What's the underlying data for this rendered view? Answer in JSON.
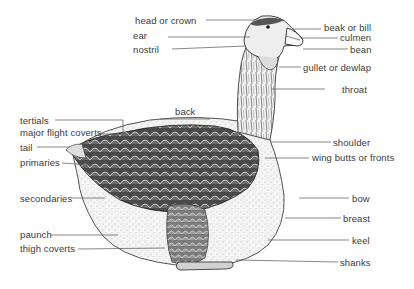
{
  "diagram": {
    "labels": [
      {
        "id": "head-or-crown",
        "text": "head or crown",
        "x": 135,
        "y": 15,
        "line": [
          206,
          20,
          258,
          20
        ]
      },
      {
        "id": "ear",
        "text": "ear",
        "x": 133,
        "y": 30,
        "line": [
          168,
          37,
          250,
          37
        ]
      },
      {
        "id": "nostril",
        "text": "nostril",
        "x": 133,
        "y": 44,
        "line": [
          172,
          49,
          246,
          46
        ]
      },
      {
        "id": "beak-or-bill",
        "text": "beak or bill",
        "x": 324,
        "y": 22,
        "line": [
          293,
          29,
          321,
          29
        ]
      },
      {
        "id": "culmen",
        "text": "culmen",
        "x": 340,
        "y": 32,
        "line": [
          302,
          38,
          338,
          38
        ]
      },
      {
        "id": "bean",
        "text": "bean",
        "x": 350,
        "y": 44,
        "line": [
          303,
          49,
          348,
          49
        ]
      },
      {
        "id": "gullet-or-dewlap",
        "text": "gullet or dewlap",
        "x": 303,
        "y": 62,
        "line": [
          279,
          67,
          301,
          67
        ]
      },
      {
        "id": "throat",
        "text": "throat",
        "x": 342,
        "y": 84,
        "line": [
          272,
          89,
          325,
          89
        ]
      },
      {
        "id": "back",
        "text": "back",
        "x": 175,
        "y": 106,
        "line": [
          160,
          119,
          210,
          119
        ]
      },
      {
        "id": "tertials",
        "text": "tertials",
        "x": 20,
        "y": 115,
        "line": [
          55,
          120,
          123,
          120,
          123,
          134
        ]
      },
      {
        "id": "major-flight-coverts",
        "text": "major flight coverts",
        "x": 20,
        "y": 127,
        "line": [
          100,
          134,
          124,
          134
        ]
      },
      {
        "id": "tail",
        "text": "tail",
        "x": 20,
        "y": 142,
        "line": [
          37,
          147,
          70,
          147
        ]
      },
      {
        "id": "primaries",
        "text": "primaries",
        "x": 20,
        "y": 157,
        "line": [
          62,
          163,
          90,
          165
        ]
      },
      {
        "id": "shoulder",
        "text": "shoulder",
        "x": 333,
        "y": 137,
        "line": [
          271,
          142,
          331,
          142
        ]
      },
      {
        "id": "wing-butts-or-fronts",
        "text": "wing butts or fronts",
        "x": 312,
        "y": 152,
        "line": [
          265,
          158,
          309,
          158
        ]
      },
      {
        "id": "secondaries",
        "text": "secondaries",
        "x": 20,
        "y": 193,
        "line": [
          72,
          198,
          105,
          198
        ]
      },
      {
        "id": "bow",
        "text": "bow",
        "x": 352,
        "y": 193,
        "line": [
          299,
          198,
          349,
          198
        ]
      },
      {
        "id": "breast",
        "text": "breast",
        "x": 343,
        "y": 213,
        "line": [
          285,
          218,
          341,
          218
        ]
      },
      {
        "id": "keel",
        "text": "keel",
        "x": 352,
        "y": 235,
        "line": [
          268,
          240,
          349,
          240
        ]
      },
      {
        "id": "paunch",
        "text": "paunch",
        "x": 20,
        "y": 229,
        "line": [
          51,
          235,
          118,
          235
        ]
      },
      {
        "id": "thigh-coverts",
        "text": "thigh coverts",
        "x": 20,
        "y": 243,
        "line": [
          78,
          249,
          165,
          248
        ]
      },
      {
        "id": "shanks",
        "text": "shanks",
        "x": 340,
        "y": 257,
        "line": [
          236,
          260,
          338,
          262
        ]
      }
    ]
  },
  "colors": {
    "label_text": "#3a3a3a",
    "leader_line": "#555555",
    "ink": "#2a2a2a",
    "dark_feather": "#3b3b3b",
    "mid_feather": "#8a8a8a",
    "light_body": "#e6e6e6"
  }
}
